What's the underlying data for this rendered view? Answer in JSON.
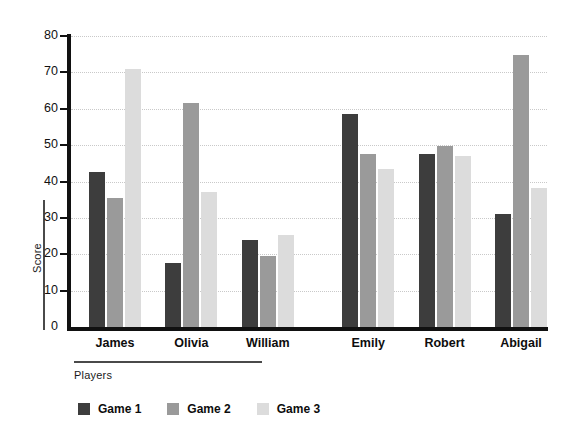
{
  "chart_data": {
    "type": "bar",
    "title": "",
    "xlabel": "Players",
    "ylabel": "Score",
    "categories": [
      "James",
      "Olivia",
      "William",
      "Emily",
      "Robert",
      "Abigail"
    ],
    "series": [
      {
        "name": "Game 1",
        "color": "#3d3d3d",
        "values": [
          42.5,
          17.5,
          23.8,
          58.5,
          47.5,
          31.0
        ]
      },
      {
        "name": "Game 2",
        "color": "#9a9a9a",
        "values": [
          35.5,
          61.5,
          19.6,
          47.5,
          49.8,
          74.8
        ]
      },
      {
        "name": "Game 3",
        "color": "#dcdcdc",
        "values": [
          71.0,
          37.0,
          25.2,
          43.5,
          47.0,
          38.2
        ]
      }
    ],
    "ylim": [
      0,
      80
    ],
    "yticks": [
      0,
      10,
      20,
      30,
      40,
      50,
      60,
      70,
      80
    ],
    "ytick_labels": [
      "0",
      "10",
      "20",
      "30",
      "40",
      "50",
      "60",
      "70",
      "80"
    ],
    "grid": true,
    "grid_style": "dotted",
    "grid_color": "#c9c9c9",
    "legend_position": "bottom",
    "axis_color": "#111111",
    "background": "#ffffff",
    "group_break_after": "William"
  }
}
